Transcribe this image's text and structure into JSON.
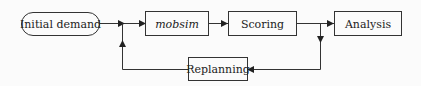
{
  "diagram": {
    "type": "flowchart",
    "nodes": [
      {
        "id": "initial_demand",
        "label": "Initial demand",
        "shape": "rounded"
      },
      {
        "id": "mobsim",
        "label": "mobsim",
        "shape": "rect",
        "italic": true
      },
      {
        "id": "scoring",
        "label": "Scoring",
        "shape": "rect"
      },
      {
        "id": "analysis",
        "label": "Analysis",
        "shape": "rect"
      },
      {
        "id": "replanning",
        "label": "Replanning",
        "shape": "rect"
      }
    ],
    "edges": [
      {
        "from": "initial_demand",
        "to": "mobsim"
      },
      {
        "from": "mobsim",
        "to": "scoring"
      },
      {
        "from": "scoring",
        "to": "analysis"
      },
      {
        "from": "scoring",
        "to": "replanning"
      },
      {
        "from": "replanning",
        "to": "mobsim"
      }
    ],
    "colors": {
      "line": "#333333",
      "background": "#fbfbfb",
      "text": "#222222"
    }
  }
}
